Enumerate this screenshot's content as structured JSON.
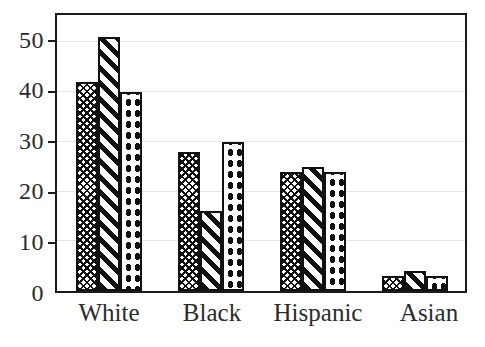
{
  "chart_data": {
    "type": "bar",
    "title": "",
    "subtitle": "",
    "xlabel": "",
    "ylabel": "",
    "categories": [
      "White",
      "Black",
      "Hispanic",
      "Asian"
    ],
    "series": [
      {
        "name": "series-1",
        "pattern": "crosshatch",
        "values": [
          42,
          28,
          24,
          3
        ]
      },
      {
        "name": "series-2",
        "pattern": "diagonal-stripes",
        "values": [
          51,
          16,
          25,
          4
        ]
      },
      {
        "name": "series-3",
        "pattern": "dots",
        "values": [
          40,
          30,
          24,
          3
        ]
      }
    ],
    "ylim": [
      0,
      55.5
    ],
    "yticks": [
      0,
      10,
      20,
      30,
      40,
      50
    ],
    "ytick_labels": [
      "0",
      "10",
      "20",
      "30",
      "40",
      "50"
    ],
    "grid": true,
    "grid_color": "#e6e6e6",
    "legend": "none",
    "axis_color": "#1a1a1a",
    "bar_edge_color": "#111111",
    "bar_fill_color": "#ffffff",
    "background": "#ffffff"
  }
}
